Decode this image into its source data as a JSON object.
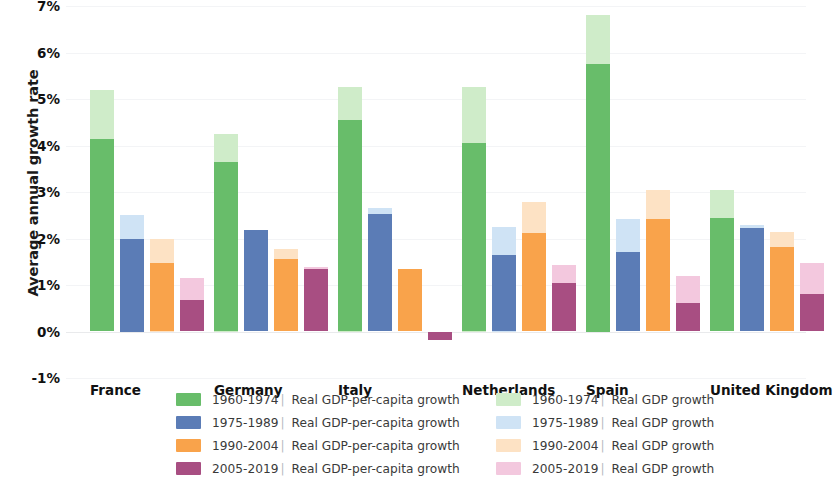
{
  "chart_data": {
    "type": "bar",
    "title": "",
    "subtitle": "",
    "xlabel": "",
    "ylabel": "Average annual growth rate",
    "categories": [
      "France",
      "Germany",
      "Italy",
      "Netherlands",
      "Spain",
      "United Kingdom"
    ],
    "ylim": [
      -1,
      7
    ],
    "ytick_labels": [
      "7%",
      "6%",
      "5%",
      "4%",
      "3%",
      "2%",
      "1%",
      "0%",
      "-1%"
    ],
    "ytick_values": [
      7,
      6,
      5,
      4,
      3,
      2,
      1,
      0,
      -1
    ],
    "grid": true,
    "legend_position": "bottom",
    "value_unit": "percent",
    "series": [
      {
        "name": "1960-1974 | Real GDP-per-capita growth",
        "period": "1960-1974",
        "metric": "Real GDP-per-capita growth",
        "color": "#68bd6a",
        "values": [
          4.15,
          3.65,
          4.55,
          4.05,
          5.75,
          2.45
        ]
      },
      {
        "name": "1960-1974 | Real GDP growth",
        "period": "1960-1974",
        "metric": "Real GDP growth",
        "color": "#cfecc9",
        "values": [
          5.2,
          4.25,
          5.25,
          5.25,
          6.8,
          3.05
        ]
      },
      {
        "name": "1975-1989 | Real GDP-per-capita growth",
        "period": "1975-1989",
        "metric": "Real GDP-per-capita growth",
        "color": "#5b7cb6",
        "values": [
          2.0,
          2.18,
          2.52,
          1.65,
          1.72,
          2.22
        ]
      },
      {
        "name": "1975-1989 | Real GDP growth",
        "period": "1975-1989",
        "metric": "Real GDP growth",
        "color": "#cfe3f5",
        "values": [
          2.5,
          2.18,
          2.65,
          2.25,
          2.42,
          2.3
        ]
      },
      {
        "name": "1990-2004 | Real GDP-per-capita growth",
        "period": "1990-2004",
        "metric": "Real GDP-per-capita growth",
        "color": "#f9a34b",
        "values": [
          1.47,
          1.55,
          1.35,
          2.12,
          2.42,
          1.82
        ]
      },
      {
        "name": "1990-2004 | Real GDP growth",
        "period": "1990-2004",
        "metric": "Real GDP growth",
        "color": "#fde2c4",
        "values": [
          2.0,
          1.78,
          1.35,
          2.78,
          3.05,
          2.15
        ]
      },
      {
        "name": "2005-2019 | Real GDP-per-capita growth",
        "period": "2005-2019",
        "metric": "Real GDP-per-capita growth",
        "color": "#a84e82",
        "values": [
          0.68,
          1.35,
          -0.18,
          1.05,
          0.62,
          0.8
        ]
      },
      {
        "name": "2005-2019 | Real GDP growth",
        "period": "2005-2019",
        "metric": "Real GDP growth",
        "color": "#f3c8de",
        "values": [
          1.15,
          1.38,
          -0.18,
          1.42,
          1.2,
          1.48
        ]
      }
    ]
  },
  "legend": {
    "left_column": [
      {
        "period": "1960-1974",
        "sep": "|",
        "metric": "Real GDP-per-capita growth",
        "color": "#68bd6a"
      },
      {
        "period": "1975-1989",
        "sep": "|",
        "metric": "Real GDP-per-capita growth",
        "color": "#5b7cb6"
      },
      {
        "period": "1990-2004",
        "sep": "|",
        "metric": "Real GDP-per-capita growth",
        "color": "#f9a34b"
      },
      {
        "period": "2005-2019",
        "sep": "|",
        "metric": "Real GDP-per-capita growth",
        "color": "#a84e82"
      }
    ],
    "right_column": [
      {
        "period": "1960-1974",
        "sep": "|",
        "metric": "Real GDP growth",
        "color": "#cfecc9"
      },
      {
        "period": "1975-1989",
        "sep": "|",
        "metric": "Real GDP growth",
        "color": "#cfe3f5"
      },
      {
        "period": "1990-2004",
        "sep": "|",
        "metric": "Real GDP growth",
        "color": "#fde2c4"
      },
      {
        "period": "2005-2019",
        "sep": "|",
        "metric": "Real GDP growth",
        "color": "#f3c8de"
      }
    ]
  }
}
